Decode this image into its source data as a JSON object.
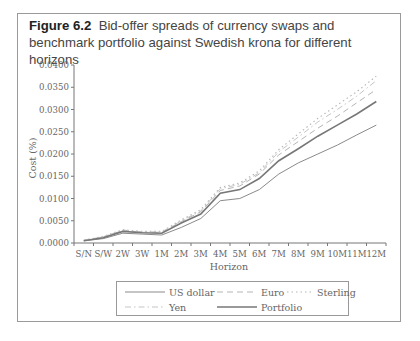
{
  "figure": {
    "label": "Figure 6.2",
    "caption": "Bid-offer spreads of currency swaps and benchmark portfolio against Swedish krona for different horizons"
  },
  "chart_data": {
    "type": "line",
    "title": "Bid-offer spreads of currency swaps and benchmark portfolio against Swedish krona for different horizons",
    "xlabel": "Horizon",
    "ylabel": "Cost (%)",
    "ylim": [
      0,
      0.04
    ],
    "yticks": [
      "0.0000",
      "0.0050",
      "0.0100",
      "0.0150",
      "0.0200",
      "0.0250",
      "0.0300",
      "0.0350",
      "0.0400"
    ],
    "grid": false,
    "legend_position": "bottom",
    "categories": [
      "S/N",
      "S/W",
      "2W",
      "3W",
      "1M",
      "2M",
      "3M",
      "4M",
      "5M",
      "6M",
      "7M",
      "8M",
      "9M",
      "10M",
      "11M",
      "12M"
    ],
    "series": [
      {
        "name": "US dollar",
        "style": "solid-thin",
        "color": "#8a8a8a",
        "values": [
          0.0005,
          0.001,
          0.0022,
          0.002,
          0.0018,
          0.0035,
          0.0055,
          0.0095,
          0.01,
          0.012,
          0.0155,
          0.018,
          0.02,
          0.022,
          0.0243,
          0.0265
        ]
      },
      {
        "name": "Euro",
        "style": "dashed",
        "color": "#b5b5b5",
        "values": [
          0.0006,
          0.0014,
          0.0028,
          0.0024,
          0.0024,
          0.0048,
          0.007,
          0.0118,
          0.0128,
          0.0155,
          0.0198,
          0.0228,
          0.0258,
          0.0285,
          0.0315,
          0.0345
        ]
      },
      {
        "name": "Sterling",
        "style": "dotted",
        "color": "#b5b5b5",
        "values": [
          0.0006,
          0.0015,
          0.003,
          0.0026,
          0.0026,
          0.0052,
          0.0075,
          0.0125,
          0.0135,
          0.0162,
          0.021,
          0.0245,
          0.028,
          0.031,
          0.034,
          0.0375
        ]
      },
      {
        "name": "Yen",
        "style": "dash-dot",
        "color": "#c5c5c5",
        "values": [
          0.0006,
          0.0014,
          0.0029,
          0.0025,
          0.0025,
          0.005,
          0.0072,
          0.0122,
          0.0132,
          0.0158,
          0.0205,
          0.0238,
          0.0272,
          0.03,
          0.033,
          0.0365
        ]
      },
      {
        "name": "Portfolio",
        "style": "solid-thick",
        "color": "#777777",
        "values": [
          0.0005,
          0.0012,
          0.0026,
          0.0023,
          0.0022,
          0.0045,
          0.0065,
          0.0112,
          0.012,
          0.0145,
          0.0185,
          0.0212,
          0.024,
          0.0265,
          0.029,
          0.0318
        ]
      }
    ]
  },
  "legend": {
    "items": [
      {
        "label": "US dollar"
      },
      {
        "label": "Euro"
      },
      {
        "label": "Sterling"
      },
      {
        "label": "Yen"
      },
      {
        "label": "Portfolio"
      }
    ]
  }
}
